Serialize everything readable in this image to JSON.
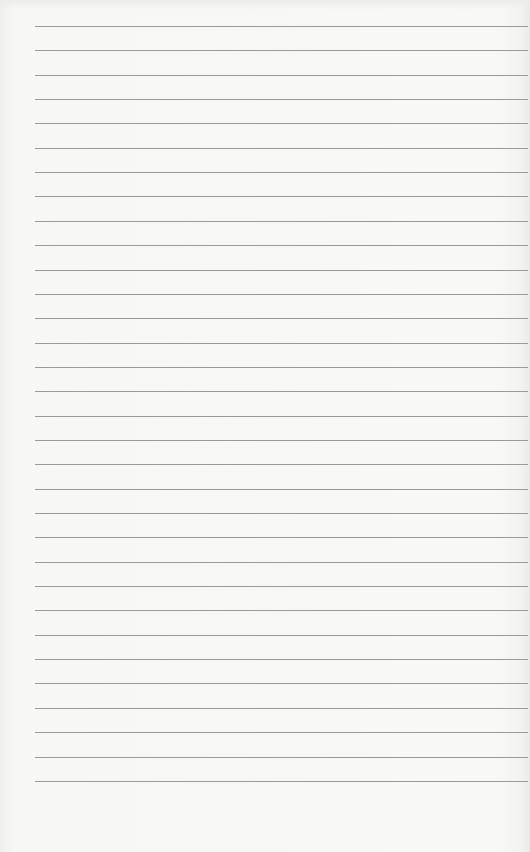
{
  "document": {
    "type": "lined-paper",
    "line_count": 32,
    "first_line_y": 26,
    "line_spacing": 24.35,
    "line_left": 35,
    "line_right": 528,
    "colors": {
      "paper": "#f6f6f5",
      "rule": "#9a9a9a"
    }
  }
}
